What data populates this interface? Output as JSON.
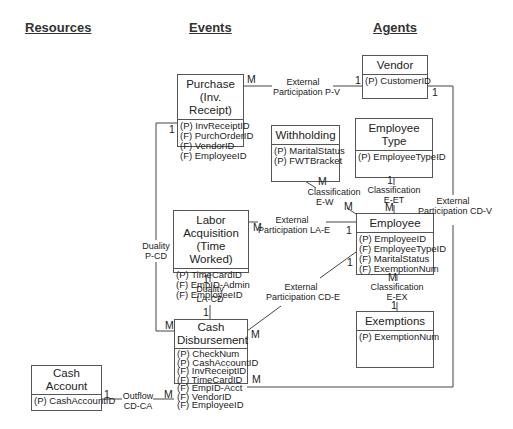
{
  "headings": {
    "resources": "Resources",
    "events": "Events",
    "agents": "Agents"
  },
  "entities": {
    "vendor": {
      "title": "Vendor",
      "attrs": [
        "(P) CustomerID"
      ]
    },
    "purchase": {
      "title_line1": "Purchase",
      "title_line2": "(Inv. Receipt)",
      "attrs": [
        "(P) InvReceiptID",
        "(F) PurchOrderID",
        "(F) VendorID",
        "(F) EmployeeID"
      ]
    },
    "withholding": {
      "title": "Withholding",
      "attrs": [
        "(P) MaritalStatus",
        "(P) FWTBracket"
      ]
    },
    "employee_type": {
      "title": "Employee Type",
      "attrs": [
        "(P) EmployeeTypeID"
      ]
    },
    "labor_acquisition": {
      "title_line1": "Labor Acquisition",
      "title_line2": "(Time Worked)",
      "attrs": [
        "(P) TimeCardID",
        "(F) EmpID-Admin",
        "(F) EmployeeID"
      ]
    },
    "employee": {
      "title": "Employee",
      "attrs": [
        "(P) EmployeeID",
        "(F) EmployeeTypeID",
        "(F) MaritalStatus",
        "(F) ExemptionNum"
      ]
    },
    "exemptions": {
      "title": "Exemptions",
      "attrs": [
        "(P) ExemptionNum"
      ]
    },
    "cash_disbursement": {
      "title_line1": "Cash",
      "title_line2": "Disbursement",
      "attrs": [
        "(P) CheckNum",
        "(P) CashAccountID",
        "(F) InvReceiptID",
        "(F) TimeCardID",
        "(F) EmpID-Acct",
        "(F) VendorID",
        "(F) EmployeeID"
      ]
    },
    "cash_account": {
      "title_line1": "Cash",
      "title_line2": "Account",
      "attrs": [
        "(P) CashAccountID"
      ]
    }
  },
  "relationships": {
    "p_v": {
      "line1": "External",
      "line2": "Participation P-V",
      "card_from": "M",
      "card_to": "1"
    },
    "p_cd": {
      "line1": "Duality",
      "line2": "P-CD",
      "card_from": "1",
      "card_to": "M"
    },
    "cd_v": {
      "line1": "External",
      "line2": "Participation CD-V",
      "card_from": "M",
      "card_to": "1"
    },
    "e_w": {
      "line1": "Classification",
      "line2": "E-W",
      "card_from": "M",
      "card_to": "M"
    },
    "e_et": {
      "line1": "Classification",
      "line2": "E-ET",
      "card_from": "M",
      "card_to": "1"
    },
    "la_e": {
      "line1": "External",
      "line2": "Participation LA-E",
      "card_from": "M",
      "card_to": "1"
    },
    "la_cd": {
      "line1": "Duality",
      "line2": "LA-CD",
      "card_from": "1",
      "card_to": "1"
    },
    "cd_e": {
      "line1": "External",
      "line2": "Participation CD-E",
      "card_from": "M",
      "card_to": "1"
    },
    "e_ex": {
      "line1": "Classification",
      "line2": "E-EX",
      "card_from": "M",
      "card_to": "1"
    },
    "cd_ca": {
      "line1": "Outflow",
      "line2": "CD-CA",
      "card_from": "M",
      "card_to": "1"
    }
  }
}
